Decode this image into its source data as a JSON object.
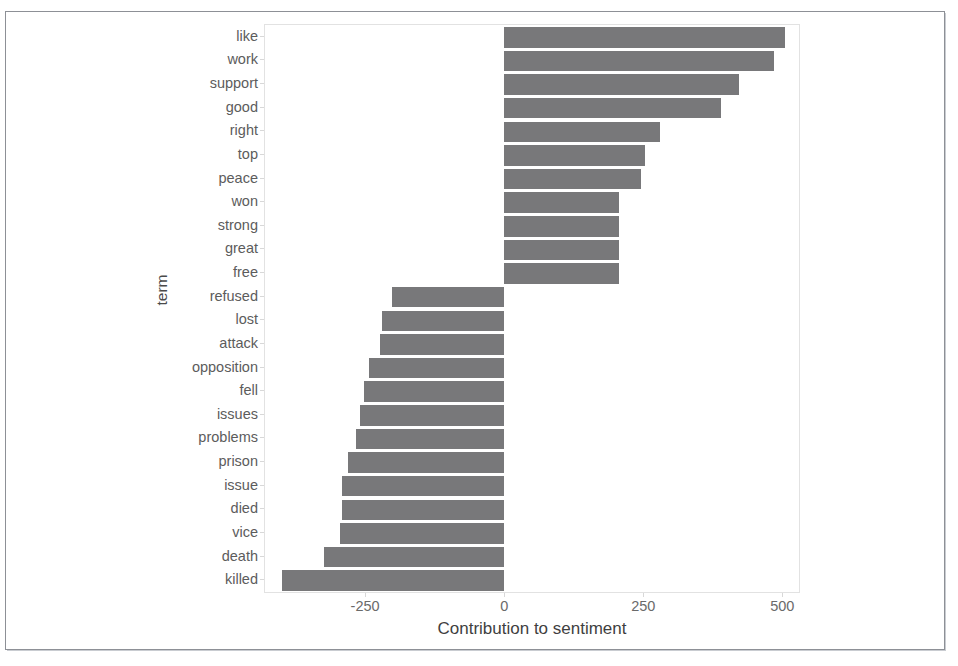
{
  "chart_data": {
    "type": "bar",
    "orientation": "horizontal",
    "title": "",
    "xlabel": "Contribution to sentiment",
    "ylabel": "term",
    "xlim": [
      -430,
      530
    ],
    "xticks": [
      -250,
      0,
      250,
      500
    ],
    "xtick_labels": [
      "-250",
      "0",
      "250",
      "500"
    ],
    "grid": false,
    "legend": null,
    "bar_color": "#78787a",
    "panel_border_color": "#e2e2e2",
    "categories": [
      "like",
      "work",
      "support",
      "good",
      "right",
      "top",
      "peace",
      "won",
      "strong",
      "great",
      "free",
      "refused",
      "lost",
      "attack",
      "opposition",
      "fell",
      "issues",
      "problems",
      "prison",
      "issue",
      "died",
      "vice",
      "death",
      "killed"
    ],
    "values": [
      504,
      485,
      422,
      389,
      280,
      254,
      246,
      206,
      206,
      206,
      206,
      -202,
      -220,
      -224,
      -243,
      -252,
      -259,
      -267,
      -280,
      -291,
      -291,
      -296,
      -324,
      -400
    ]
  }
}
